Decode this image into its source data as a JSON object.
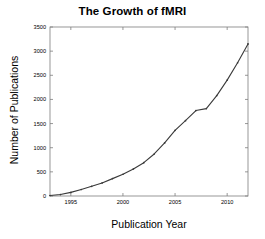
{
  "chart_data": {
    "type": "line",
    "title": "The Growth of fMRI",
    "xlabel": "Publication Year",
    "ylabel": "Number of Publications",
    "xlim": [
      1993,
      2012
    ],
    "ylim": [
      0,
      3500
    ],
    "xticks": [
      1995,
      2000,
      2005,
      2010
    ],
    "xticklabels": [
      "1995",
      "2000",
      "2005",
      "2010"
    ],
    "yticks": [
      0,
      500,
      1000,
      1500,
      2000,
      2500,
      3000,
      3500
    ],
    "yticklabels": [
      "0",
      "500",
      "1000",
      "1500",
      "2000",
      "2500",
      "3000",
      "3500"
    ],
    "grid": false,
    "legend": null,
    "line_color": "#3a3a3a",
    "marker": "point",
    "series": [
      {
        "name": "fMRI publications",
        "x": [
          1993,
          1994,
          1995,
          1996,
          1997,
          1998,
          1999,
          2000,
          2001,
          2002,
          2003,
          2004,
          2005,
          2006,
          2007,
          2008,
          2009,
          2010,
          2011,
          2012
        ],
        "values": [
          10,
          30,
          75,
          135,
          200,
          270,
          360,
          450,
          560,
          690,
          870,
          1100,
          1360,
          1560,
          1770,
          1810,
          2080,
          2400,
          2760,
          3150
        ]
      }
    ]
  }
}
